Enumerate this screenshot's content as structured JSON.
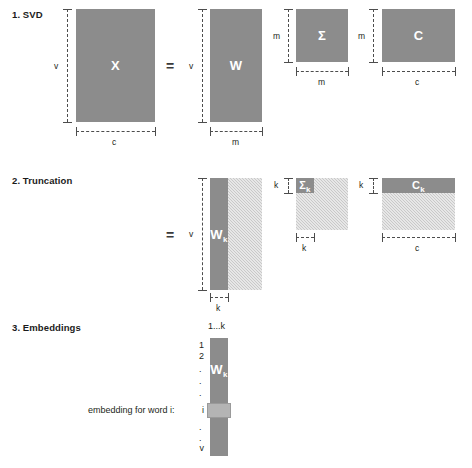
{
  "figure": {
    "colors": {
      "matrix_fill": "#8c8c8c",
      "truncated_fill": "#c9c9c9",
      "text": "#231f20",
      "rule": "#4d4d4d",
      "label_text": "#ffffff",
      "background": "#ffffff"
    }
  },
  "sections": {
    "svd": {
      "heading": "1. SVD",
      "equals": "=",
      "matrices": {
        "x": {
          "label": "X",
          "rows_dim": "v",
          "cols_dim": "c"
        },
        "w": {
          "label": "W",
          "rows_dim": "v",
          "cols_dim": "m"
        },
        "sigma": {
          "label": "Σ",
          "rows_dim": "m",
          "cols_dim": "m"
        },
        "c": {
          "label": "C",
          "rows_dim": "m",
          "cols_dim": "c"
        }
      }
    },
    "truncation": {
      "heading": "2. Truncation",
      "equals": "=",
      "matrices": {
        "wk": {
          "label": "W",
          "sub": "k",
          "rows_dim": "v",
          "cols_dim": "k"
        },
        "sigmak": {
          "label": "Σ",
          "sub": "k",
          "rows_dim": "k",
          "cols_dim": "k"
        },
        "ck": {
          "label": "C",
          "sub": "k",
          "rows_dim": "k",
          "cols_dim": "c"
        }
      }
    },
    "embeddings": {
      "heading": "3. Embeddings",
      "matrix": {
        "label": "W",
        "sub": "k"
      },
      "column_header": "1...k",
      "row_labels": [
        "1",
        "2",
        "i",
        "v"
      ],
      "row_dots": [
        ".",
        ".",
        ".",
        ".",
        "."
      ],
      "caption": "embedding for word i:"
    }
  }
}
